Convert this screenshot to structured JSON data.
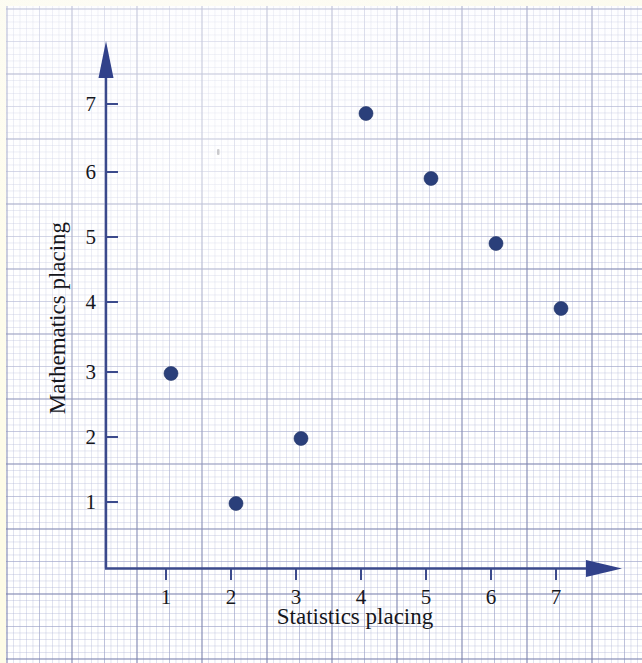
{
  "page": {
    "background_color": "#fdfbe6",
    "paper_color": "#ffffff",
    "grid_line_color": "#787eaa",
    "axis_color": "#3b4a8c",
    "marker_color": "#2a3f7a"
  },
  "chart_data": {
    "type": "scatter",
    "title": "",
    "xlabel": "Statistics placing",
    "ylabel": "Mathematics placing",
    "xlim": [
      0,
      7.8
    ],
    "ylim": [
      0,
      7.8
    ],
    "grid": true,
    "legend": "none",
    "x_ticks": [
      "1",
      "2",
      "3",
      "4",
      "5",
      "6",
      "7"
    ],
    "y_ticks": [
      "1",
      "2",
      "3",
      "4",
      "5",
      "6",
      "7"
    ],
    "x": [
      1,
      2,
      3,
      4,
      5,
      6,
      7
    ],
    "y": [
      3,
      1,
      2,
      7,
      6,
      5,
      4
    ],
    "points": [
      {
        "label": "point-1",
        "x": 1,
        "y": 3
      },
      {
        "label": "point-2",
        "x": 2,
        "y": 1
      },
      {
        "label": "point-3",
        "x": 3,
        "y": 2
      },
      {
        "label": "point-4",
        "x": 4,
        "y": 7
      },
      {
        "label": "point-5",
        "x": 5,
        "y": 6
      },
      {
        "label": "point-6",
        "x": 6,
        "y": 5
      },
      {
        "label": "point-7",
        "x": 7,
        "y": 4
      }
    ]
  },
  "axes": {
    "x_title": "Statistics placing",
    "y_title": "Mathematics placing",
    "x_tick_labels": [
      "1",
      "2",
      "3",
      "4",
      "5",
      "6",
      "7"
    ],
    "y_tick_labels": [
      "1",
      "2",
      "3",
      "4",
      "5",
      "6",
      "7"
    ]
  }
}
